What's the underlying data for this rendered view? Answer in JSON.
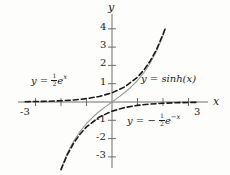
{
  "chart_data": {
    "type": "line",
    "title": "",
    "xlabel": "x",
    "ylabel": "y",
    "xlim": [
      -3.6,
      3.6
    ],
    "ylim": [
      -3.6,
      4.4
    ],
    "xticks": [
      -3,
      -2,
      -1,
      1,
      2,
      3
    ],
    "yticks": [
      -3,
      -2,
      -1,
      1,
      2,
      3,
      4
    ],
    "xtick_labels_shown": [
      "-3",
      "3"
    ],
    "ytick_labels_shown": [
      "4",
      "3",
      "2",
      "1",
      "-1",
      "-2",
      "-3"
    ],
    "grid": false,
    "legend": "inline-annotations",
    "series": [
      {
        "name": "y = sinh(x)",
        "style": "solid",
        "color": "#9a9a9a",
        "x": [
          -3.0,
          -2.75,
          -2.5,
          -2.25,
          -2.0,
          -1.75,
          -1.5,
          -1.25,
          -1.0,
          -0.75,
          -0.5,
          -0.25,
          0.0,
          0.25,
          0.5,
          0.75,
          1.0,
          1.25,
          1.5,
          1.75,
          2.0,
          2.1
        ],
        "y": [
          -10.018,
          -7.789,
          -6.05,
          -4.691,
          -3.627,
          -2.79,
          -2.129,
          -1.602,
          -1.175,
          -0.822,
          -0.521,
          -0.253,
          0.0,
          0.253,
          0.521,
          0.822,
          1.175,
          1.602,
          2.129,
          2.79,
          3.627,
          4.022
        ]
      },
      {
        "name": "y = 1/2 e^x",
        "style": "dashed",
        "color": "#1a1a1a",
        "x": [
          -3.4,
          -3.0,
          -2.5,
          -2.0,
          -1.5,
          -1.0,
          -0.5,
          0.0,
          0.5,
          1.0,
          1.25,
          1.5,
          1.75,
          2.0,
          2.1
        ],
        "y": [
          0.0167,
          0.0249,
          0.041,
          0.0677,
          0.1116,
          0.1839,
          0.3033,
          0.5,
          0.8244,
          1.3591,
          1.7463,
          2.2408,
          2.8763,
          3.6945,
          4.0822
        ]
      },
      {
        "name": "y = -1/2 e^-x",
        "style": "dashed",
        "color": "#1a1a1a",
        "x": [
          -2.1,
          -2.0,
          -1.75,
          -1.5,
          -1.25,
          -1.0,
          -0.5,
          0.0,
          0.5,
          1.0,
          1.5,
          2.0,
          2.5,
          3.0,
          3.4
        ],
        "y": [
          -4.0822,
          -3.6945,
          -2.8763,
          -2.2408,
          -1.7463,
          -1.3591,
          -0.8244,
          -0.5,
          -0.3033,
          -0.1839,
          -0.1116,
          -0.0677,
          -0.041,
          -0.0249,
          -0.0167
        ]
      }
    ]
  },
  "annotations": {
    "exp_pos": {
      "lhs": "y =",
      "frac_num": "1",
      "frac_den": "2",
      "base": "e",
      "exponent": "x"
    },
    "sinh": {
      "text": "y = sinh(x)"
    },
    "exp_neg": {
      "lhs": "y = −",
      "frac_num": "1",
      "frac_den": "2",
      "base": "e",
      "exponent": "−x"
    }
  },
  "axes": {
    "x_name": "x",
    "y_name": "y",
    "x_left_label": "-3",
    "x_right_label": "3",
    "y_label_4": "4",
    "y_label_3": "3",
    "y_label_2": "2",
    "y_label_1": "1",
    "y_label_m1": "-1",
    "y_label_m2": "-2",
    "y_label_m3": "-3"
  },
  "colors": {
    "background": "#fdfdfb",
    "axis": "#6e6e6e",
    "curve_dashed": "#1a1a1a",
    "curve_solid": "#9a9a9a",
    "text": "#1a1a1a"
  }
}
